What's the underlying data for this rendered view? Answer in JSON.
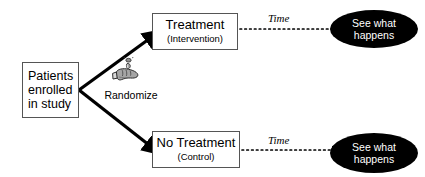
{
  "diagram": {
    "type": "flowchart",
    "background_color": "#ffffff",
    "nodes": {
      "start": {
        "lines": [
          "Patients",
          "enrolled",
          "in study"
        ],
        "shape": "rectangle",
        "fill": "#ffffff",
        "border_color": "#555555"
      },
      "treatment": {
        "main_label": "Treatment",
        "sub_label": "(Intervention)",
        "shape": "rectangle",
        "fill": "#ffffff",
        "border_color": "#555555"
      },
      "control": {
        "main_label": "No Treatment",
        "sub_label": "(Control)",
        "shape": "rectangle",
        "fill": "#ffffff",
        "border_color": "#555555"
      },
      "outcome_top": {
        "lines": [
          "See what",
          "happens"
        ],
        "shape": "ellipse",
        "fill": "#000000",
        "text_color": "#ffffff"
      },
      "outcome_bottom": {
        "lines": [
          "See what",
          "happens"
        ],
        "shape": "ellipse",
        "fill": "#000000",
        "text_color": "#ffffff"
      }
    },
    "edges": {
      "randomize_label": "Randomize",
      "randomize_icon": "hand-flipping-coin-icon",
      "time_top_label": "Time",
      "time_bottom_label": "Time",
      "split_arrow_style": "solid-thick-black",
      "time_arrow_style": "dotted-black"
    }
  }
}
